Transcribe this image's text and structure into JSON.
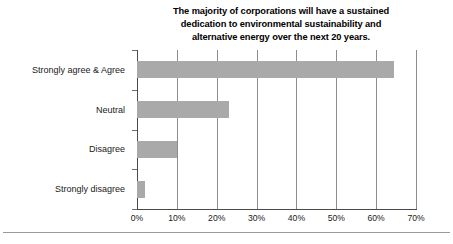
{
  "chart_data": {
    "type": "bar",
    "orientation": "horizontal",
    "title": "The majority of corporations will have a sustained dedication to environmental sustainability and alternative energy over the next 20 years.",
    "title_lines": [
      "The majority of corporations will have a sustained",
      "dedication to environmental sustainability and",
      "alternative energy over the next 20 years."
    ],
    "categories": [
      "Strongly agree & Agree",
      "Neutral",
      "Disagree",
      "Strongly disagree"
    ],
    "values": [
      64.5,
      23.0,
      10.0,
      2.0
    ],
    "xlabel": "",
    "ylabel": "",
    "xlim": [
      0,
      70
    ],
    "xticks": [
      0,
      10,
      20,
      30,
      40,
      50,
      60,
      70
    ],
    "xtick_labels": [
      "0%",
      "10%",
      "20%",
      "30%",
      "40%",
      "50%",
      "60%",
      "70%"
    ],
    "grid": true,
    "grid_axis": "x",
    "legend": false,
    "bar_color": "#a9a9a9",
    "axis_color": "#4a4a4a",
    "gridline_color": "#8d8d8d",
    "text_color": "#1a1a1a",
    "background": "#ffffff"
  }
}
